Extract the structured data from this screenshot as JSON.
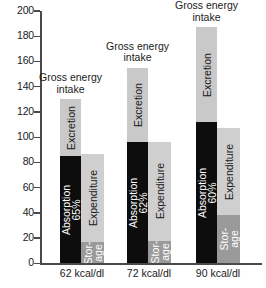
{
  "chart_data": {
    "type": "bar",
    "title": "",
    "subtitle": "",
    "xlabel": "",
    "ylabel": "",
    "ylim": [
      0,
      200
    ],
    "ytick_step": 20,
    "yticks": [
      200,
      180,
      160,
      140,
      120,
      100,
      80,
      60,
      40,
      20,
      0
    ],
    "grid": false,
    "legend": "none (in-bar labels)",
    "categories": [
      "62 kcal/dl",
      "72 kcal/dl",
      "90 kcal/dl"
    ],
    "group_title": "Gross energy intake",
    "group_title_line1": "Gross energy",
    "group_title_line2": "intake",
    "series": [
      {
        "name": "Absorption",
        "values": [
          85,
          96,
          112
        ],
        "bar": "intake",
        "color": "#0d0d0d"
      },
      {
        "name": "Excretion",
        "values": [
          45,
          59,
          75
        ],
        "bar": "intake",
        "color": "#c9c9c9"
      },
      {
        "name": "Storage",
        "values": [
          17,
          18,
          38
        ],
        "bar": "expenditure",
        "color": "#9a9a9a"
      },
      {
        "name": "Expenditure",
        "values": [
          70,
          78,
          69
        ],
        "bar": "expenditure",
        "color": "#cfcfcf"
      }
    ],
    "bar_totals": {
      "intake": [
        130,
        155,
        187
      ],
      "expenditure": [
        87,
        96,
        107
      ]
    },
    "groups": [
      {
        "xlabel": "62 kcal/dl",
        "title_line1": "Gross energy",
        "title_line2": "intake",
        "intake": [
          {
            "label": "Absorption",
            "sublabel": "65%",
            "value": 85,
            "color": "#0d0d0d",
            "text": "#ffffff"
          },
          {
            "label": "Excretion",
            "sublabel": "",
            "value": 45,
            "color": "#c9c9c9",
            "text": "#1a1a1a"
          }
        ],
        "expenditure": [
          {
            "label": "Storage",
            "sublabel": "",
            "value": 17,
            "color": "#9a9a9a",
            "text": "#ffffff"
          },
          {
            "label": "Expenditure",
            "sublabel": "",
            "value": 70,
            "color": "#cfcfcf",
            "text": "#1a1a1a"
          }
        ]
      },
      {
        "xlabel": "72 kcal/dl",
        "title_line1": "Gross energy",
        "title_line2": "intake",
        "intake": [
          {
            "label": "Absorption",
            "sublabel": "62%",
            "value": 96,
            "color": "#0d0d0d",
            "text": "#ffffff"
          },
          {
            "label": "Excretion",
            "sublabel": "",
            "value": 59,
            "color": "#c9c9c9",
            "text": "#1a1a1a"
          }
        ],
        "expenditure": [
          {
            "label": "Storage",
            "sublabel": "",
            "value": 18,
            "color": "#9a9a9a",
            "text": "#ffffff"
          },
          {
            "label": "Expenditure",
            "sublabel": "",
            "value": 78,
            "color": "#cfcfcf",
            "text": "#1a1a1a"
          }
        ]
      },
      {
        "xlabel": "90 kcal/dl",
        "title_line1": "Gross energy",
        "title_line2": "intake",
        "intake": [
          {
            "label": "Absorption",
            "sublabel": "60%",
            "value": 112,
            "color": "#0d0d0d",
            "text": "#ffffff"
          },
          {
            "label": "Excretion",
            "sublabel": "",
            "value": 75,
            "color": "#c9c9c9",
            "text": "#1a1a1a"
          }
        ],
        "expenditure": [
          {
            "label": "Storage",
            "sublabel": "",
            "value": 38,
            "color": "#9a9a9a",
            "text": "#ffffff"
          },
          {
            "label": "Expenditure",
            "sublabel": "",
            "value": 69,
            "color": "#cfcfcf",
            "text": "#1a1a1a"
          }
        ]
      }
    ],
    "storage_label_line1": "Stor-",
    "storage_label_line2": "age"
  }
}
